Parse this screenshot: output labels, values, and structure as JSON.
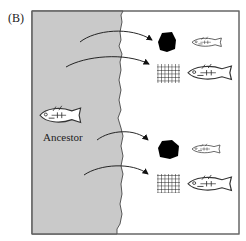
{
  "panel": {
    "label": "(B)"
  },
  "ancestor": {
    "label": "Ancestor",
    "icon": "stickleback-fish-icon"
  },
  "colors": {
    "ocean": "#c9c9c9",
    "freshwater": "#ffffff",
    "frame": "#555555",
    "ink": "#111111"
  },
  "colonizations": [
    {
      "habitat": "benthic",
      "habitat_icon": "black-rock-icon",
      "fish_icon": "small-stickleback-icon"
    },
    {
      "habitat": "limnetic",
      "habitat_icon": "grid-net-icon",
      "fish_icon": "large-stickleback-icon"
    },
    {
      "habitat": "benthic",
      "habitat_icon": "black-rock-icon",
      "fish_icon": "small-stickleback-icon"
    },
    {
      "habitat": "limnetic",
      "habitat_icon": "grid-net-icon",
      "fish_icon": "large-stickleback-icon"
    }
  ]
}
